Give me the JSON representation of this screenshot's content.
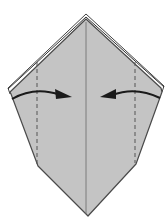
{
  "diagram": {
    "type": "origami-fold-step",
    "colors": {
      "paper": "#c4c4c4",
      "paper_edge": "#555555",
      "back_layer": "#ffffff",
      "outline": "#444444",
      "arrow": "#1a1a1a",
      "valley_line": "#555555"
    },
    "elements": {
      "center_crease": {
        "x": 86,
        "y1": 22,
        "y2": 214
      },
      "valley_fold_left": {
        "x": 37,
        "y1": 62,
        "y2": 165
      },
      "valley_fold_right": {
        "x": 135,
        "y1": 62,
        "y2": 163
      },
      "arrow_left": {
        "from": [
          12,
          98
        ],
        "to": [
          70,
          97
        ],
        "direction": "right"
      },
      "arrow_right": {
        "from": [
          160,
          97
        ],
        "to": [
          102,
          97
        ],
        "direction": "left"
      }
    }
  }
}
